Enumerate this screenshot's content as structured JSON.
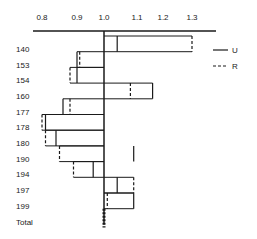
{
  "chart_data": {
    "type": "bar",
    "title": "",
    "xlabel": "",
    "ylabel": "",
    "orientation": "horizontal",
    "baseline": 1.0,
    "xlim": [
      0.79,
      1.33
    ],
    "x_ticks": [
      {
        "label": "0.8",
        "value": 0.8,
        "px": 42
      },
      {
        "label": "0.9",
        "value": 0.9,
        "px": 77
      },
      {
        "label": "1.0",
        "value": 1.0,
        "px": 104
      },
      {
        "label": "1.1",
        "value": 1.1,
        "px": 137
      },
      {
        "label": "1.2",
        "value": 1.2,
        "px": 163
      },
      {
        "label": "1.3",
        "value": 1.3,
        "px": 192
      }
    ],
    "categories": [
      "140",
      "153",
      "154",
      "160",
      "177",
      "178",
      "180",
      "190",
      "194",
      "197",
      "199",
      "Total"
    ],
    "series": [
      {
        "name": "U",
        "style": "solid",
        "values": [
          1.04,
          0.9,
          0.9,
          1.16,
          0.86,
          0.81,
          0.84,
          1.09,
          0.96,
          1.04,
          1.09,
          1.0
        ]
      },
      {
        "name": "R",
        "style": "dashed",
        "values": [
          1.3,
          0.91,
          0.88,
          1.08,
          0.88,
          0.8,
          0.81,
          0.85,
          0.89,
          1.09,
          1.01,
          1.0
        ]
      }
    ],
    "legend": {
      "position": "right-top",
      "entries": [
        {
          "label": "U",
          "style": "solid"
        },
        {
          "label": "R",
          "style": "dashed"
        }
      ]
    },
    "grid": false
  }
}
